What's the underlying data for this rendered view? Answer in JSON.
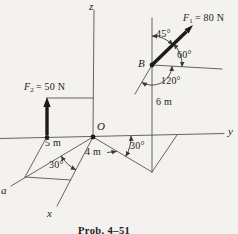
{
  "figure": {
    "caption": "Prob. 4–51",
    "axis_labels": {
      "x": "x",
      "y": "y",
      "z": "z",
      "a": "a"
    },
    "point_labels": {
      "origin": "O",
      "b": "B"
    },
    "force_labels": {
      "f1": {
        "symbol": "F",
        "subscript": "1",
        "value": "= 80 N"
      },
      "f2": {
        "symbol": "F",
        "subscript": "2",
        "value": "= 50 N"
      }
    },
    "angle_labels": {
      "b_45": "45°",
      "b_60": "60°",
      "b_120": "120°",
      "ground_right": "30°",
      "ground_left": "30°"
    },
    "dimension_labels": {
      "pole": "6 m",
      "left": "5 m",
      "ground": "4 m"
    },
    "colors": {
      "paper": "#f4f2ee",
      "ink": "#23211e",
      "line": "#4d4a45"
    }
  }
}
